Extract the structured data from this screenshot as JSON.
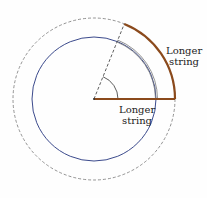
{
  "diagram": {
    "center": [
      94,
      99
    ],
    "inner_radius": 62,
    "outer_radius": 81,
    "angle_deg": 68,
    "colors": {
      "inner_circle": "#3b4a8c",
      "outer_circle": "#666666",
      "string": "#8b4a1c",
      "inner_arc": "#777777"
    },
    "labels": {
      "outer_line1": "Longer",
      "outer_line2": "string",
      "radius_line1": "Longer",
      "radius_line2": "string"
    }
  }
}
